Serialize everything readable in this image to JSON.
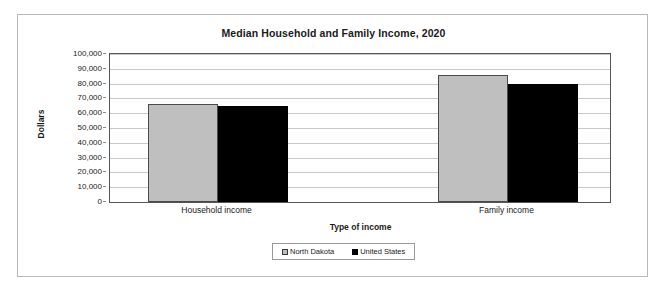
{
  "chart_data": {
    "type": "bar",
    "title": "Median Household and Family Income, 2020",
    "xlabel": "Type of income",
    "ylabel": "Dollars",
    "categories": [
      "Household income",
      "Family income"
    ],
    "series": [
      {
        "name": "North Dakota",
        "color": "#bfbfbf",
        "values": [
          66500,
          86000
        ]
      },
      {
        "name": "United States",
        "color": "#000000",
        "values": [
          65000,
          80000
        ]
      }
    ],
    "ylim": [
      0,
      100000
    ],
    "ytick_labels": [
      "100,000",
      "90,000",
      "80,000",
      "70,000",
      "60,000",
      "50,000",
      "40,000",
      "30,000",
      "20,000",
      "10,000",
      "0"
    ],
    "ytick_values": [
      100000,
      90000,
      80000,
      70000,
      60000,
      50000,
      40000,
      30000,
      20000,
      10000,
      0
    ],
    "grid": true,
    "legend_position": "bottom",
    "legend_entries": [
      "North Dakota",
      "United States"
    ]
  }
}
